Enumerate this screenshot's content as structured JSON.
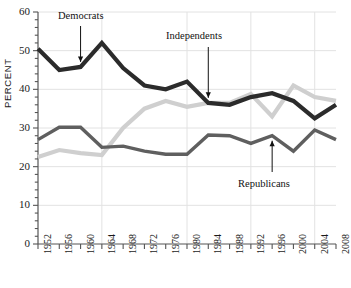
{
  "chart_data": {
    "type": "line",
    "title": "",
    "xlabel": "",
    "ylabel": "PERCENT",
    "ylim": [
      0,
      60
    ],
    "xlim": [
      1952,
      2008
    ],
    "grid": true,
    "legend_position": "inline-annotations",
    "y_ticks": [
      "0",
      "10",
      "20",
      "30",
      "40",
      "50",
      "60"
    ],
    "y_tick_values": [
      0,
      10,
      20,
      30,
      40,
      50,
      60
    ],
    "y_minor_step": 2,
    "x": [
      1952,
      1956,
      1960,
      1964,
      1968,
      1972,
      1976,
      1980,
      1984,
      1988,
      1992,
      1996,
      2000,
      2004,
      2008
    ],
    "categories": [
      "1952",
      "1956",
      "1960",
      "1964",
      "1968",
      "1972",
      "1976",
      "1980",
      "1984",
      "1988",
      "1992",
      "1996",
      "2000",
      "2004",
      "2008"
    ],
    "vertical_gridlines": [
      1964,
      1980,
      1992,
      2004
    ],
    "series": [
      {
        "name": "Democrats",
        "color": "#2b2b2b",
        "width": 4.2,
        "values": [
          50.5,
          45.0,
          45.8,
          52.0,
          45.5,
          41.0,
          40.0,
          42.0,
          36.5,
          36.0,
          38.0,
          39.0,
          37.0,
          32.5,
          36.0
        ]
      },
      {
        "name": "Republicans",
        "color": "#5f5f5f",
        "width": 3.4,
        "values": [
          27.0,
          30.2,
          30.2,
          25.0,
          25.3,
          24.0,
          23.2,
          23.2,
          28.2,
          28.0,
          26.0,
          28.0,
          24.0,
          29.5,
          27.0
        ]
      },
      {
        "name": "Independents",
        "color": "#cfcfcf",
        "width": 4.2,
        "values": [
          22.5,
          24.3,
          23.5,
          23.0,
          30.0,
          35.0,
          37.0,
          35.5,
          36.5,
          36.5,
          38.8,
          33.0,
          41.0,
          38.0,
          37.0
        ]
      }
    ],
    "annotations": [
      {
        "label": "Democrats",
        "target_series": "Democrats",
        "target_x": 1960
      },
      {
        "label": "Independents",
        "target_series": "Independents",
        "target_x": 1984
      },
      {
        "label": "Republicans",
        "target_series": "Republicans",
        "target_x": 1996
      }
    ]
  },
  "annotation_labels": {
    "democrats": "Democrats",
    "independents": "Independents",
    "republicans": "Republicans"
  }
}
